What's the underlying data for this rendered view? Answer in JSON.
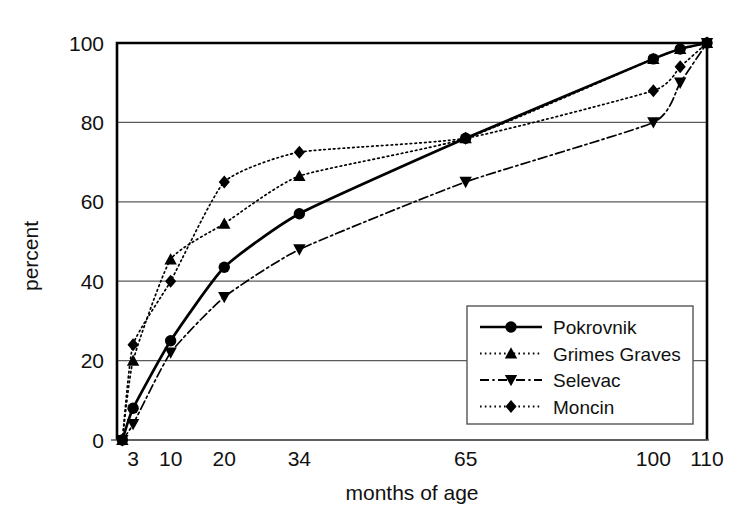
{
  "chart_data": {
    "type": "line",
    "title": "",
    "xlabel": "months of age",
    "ylabel": "percent",
    "xlim": [
      0,
      110
    ],
    "ylim": [
      0,
      100
    ],
    "grid": "horizontal",
    "legend_position": "inside-bottom-right",
    "xticks": [
      3,
      10,
      20,
      34,
      65,
      100,
      110
    ],
    "xtick_labels": [
      "3",
      "10",
      "20",
      "34",
      "65",
      "100",
      "110"
    ],
    "yticks": [
      0,
      20,
      40,
      60,
      80,
      100
    ],
    "ytick_labels": [
      "0",
      "20",
      "40",
      "60",
      "80",
      "100"
    ],
    "x": [
      1,
      3,
      10,
      20,
      34,
      65,
      100,
      105,
      110
    ],
    "series": [
      {
        "name": "Pokrovnik",
        "marker": "circle",
        "line_style": "solid",
        "color": "#000000",
        "values": [
          0,
          8,
          25,
          43.5,
          57,
          76,
          96,
          98.5,
          100
        ]
      },
      {
        "name": "Grimes Graves",
        "marker": "triangle-up",
        "line_style": "dotted",
        "color": "#000000",
        "values": [
          0,
          20,
          45.5,
          54.5,
          66.5,
          76,
          96,
          98.5,
          100
        ]
      },
      {
        "name": "Selevac",
        "marker": "triangle-down",
        "line_style": "dash-dot",
        "color": "#000000",
        "values": [
          0,
          4,
          22,
          36,
          48,
          65,
          80,
          90,
          100
        ]
      },
      {
        "name": "Moncin",
        "marker": "diamond",
        "line_style": "dotted",
        "color": "#000000",
        "values": [
          0,
          24,
          40,
          65,
          72.5,
          76,
          88,
          94,
          100
        ]
      }
    ]
  },
  "axes": {
    "ylabel": "percent",
    "xlabel": "months of age",
    "ytick_0": "0",
    "ytick_20": "20",
    "ytick_40": "40",
    "ytick_60": "60",
    "ytick_80": "80",
    "ytick_100": "100",
    "xtick_3": "3",
    "xtick_10": "10",
    "xtick_20": "20",
    "xtick_34": "34",
    "xtick_65": "65",
    "xtick_100": "100",
    "xtick_110": "110"
  },
  "legend": {
    "items": [
      {
        "label": "Pokrovnik"
      },
      {
        "label": "Grimes Graves"
      },
      {
        "label": "Selevac"
      },
      {
        "label": "Moncin"
      }
    ]
  },
  "colors": {
    "ink": "#000000",
    "grid": "#5a5a5a",
    "frame": "#000000",
    "background": "#ffffff"
  }
}
